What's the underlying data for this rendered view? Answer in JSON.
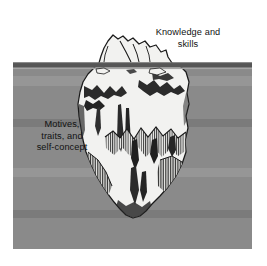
{
  "figure": {
    "name": "iceberg-competency-model",
    "width": 267,
    "height": 266,
    "background_color": "#ffffff"
  },
  "water": {
    "name": "water-field",
    "fill_color": "#8a8a8a",
    "left": 13,
    "top": 63,
    "right": 252,
    "bottom": 249
  },
  "waterline": {
    "name": "waterline",
    "band_color": "#565656",
    "highlight_color": "#a6a6a6",
    "y": 63,
    "thickness": 5
  },
  "iceberg": {
    "name": "iceberg",
    "fill_color": "#f2f2f0",
    "outline_color": "#1a1a1a",
    "shading_color": "#2b2b2b",
    "tip_top_y": 35,
    "bottom_y": 218,
    "widest_left_x": 78,
    "widest_right_x": 189
  },
  "labels": {
    "above_water": {
      "name": "knowledge-and-skills-label",
      "text": "Knowledge and\nskills",
      "line1": "Knowledge and",
      "line2": "skills",
      "color": "#111111"
    },
    "below_water": {
      "name": "motives-traits-self-concept-label",
      "text": "Motives,\ntraits, and\nself-concept",
      "line1": "Motives,",
      "line2": "traits, and",
      "line3": "self-concept",
      "color": "#111111"
    }
  }
}
